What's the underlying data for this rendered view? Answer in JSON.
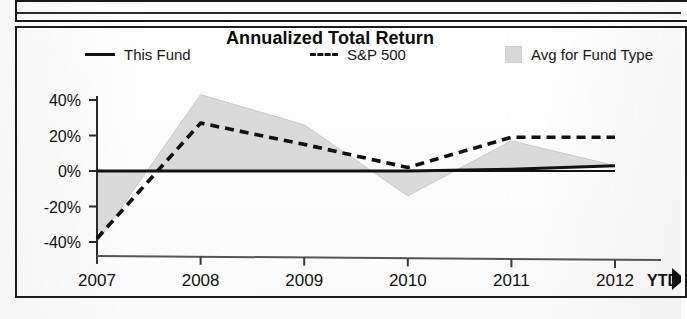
{
  "chart_data": {
    "type": "line",
    "title": "Annualized Total Return",
    "xlabel": "",
    "ylabel": "",
    "categories": [
      "2007",
      "2008",
      "2009",
      "2010",
      "2011",
      "2012 YTD"
    ],
    "x_tick_labels": [
      "2007",
      "2008",
      "2009",
      "2010",
      "2011",
      "2012"
    ],
    "x_suffix_label": "YTD",
    "y_tick_labels": [
      "40%",
      "20%",
      "0%",
      "-20%",
      "-40%"
    ],
    "y_tick_values": [
      40,
      20,
      0,
      -20,
      -40
    ],
    "ylim": [
      -50,
      48
    ],
    "grid": false,
    "legend_position": "top",
    "series": [
      {
        "name": "This Fund",
        "style": "solid",
        "color": "#111111",
        "values": [
          0,
          0,
          0,
          0,
          1,
          3
        ]
      },
      {
        "name": "S&P 500",
        "style": "dashed",
        "color": "#111111",
        "values": [
          -38,
          27,
          15,
          2,
          19,
          19
        ]
      },
      {
        "name": "Avg for Fund Type",
        "style": "shaded-band",
        "color": "#d8d8d8",
        "values": [
          -40,
          43,
          26,
          -14,
          17,
          3
        ],
        "band_note": "gray region spans between the Avg for Fund Type bound and the This Fund line"
      }
    ],
    "annotations": []
  },
  "chart": {
    "title": "Annualized Total Return",
    "legend": [
      {
        "label": "This Fund",
        "marker": "solid-line-swatch"
      },
      {
        "label": "S&P 500",
        "marker": "dashed-line-swatch"
      },
      {
        "label": "Avg for Fund Type",
        "marker": "gray-box-swatch"
      }
    ],
    "y_axis": {
      "ticks": [
        "40%",
        "20%",
        "0%",
        "-20%",
        "-40%"
      ]
    },
    "x_axis": {
      "ticks": [
        "2007",
        "2008",
        "2009",
        "2010",
        "2011",
        "2012"
      ],
      "trailing_label": "YTD"
    }
  }
}
